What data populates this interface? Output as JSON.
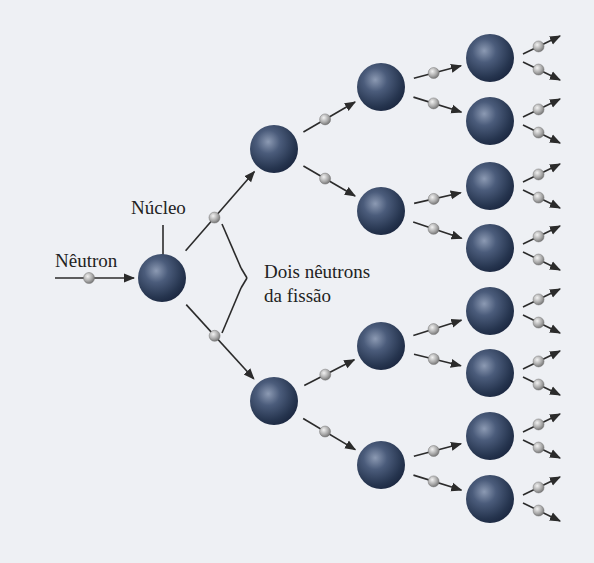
{
  "diagram": {
    "title": "",
    "type": "nuclear-fission-chain-reaction",
    "labels": {
      "neutron": "Nêutron",
      "nucleus": "Núcleo",
      "fission_neutrons_line1": "Dois nêutrons",
      "fission_neutrons_line2": "da fissão"
    },
    "colors": {
      "background": "#eef0f4",
      "nucleus": "#2e3f5c",
      "nucleus_highlight": "#8c9ab3",
      "neutron": "#a9a9a9",
      "line": "#2b2b2b",
      "text": "#222222"
    },
    "nodes": [
      {
        "id": "n0",
        "generation": 0,
        "x": 162,
        "y": 278
      },
      {
        "id": "n1a",
        "generation": 1,
        "x": 274,
        "y": 149
      },
      {
        "id": "n1b",
        "generation": 1,
        "x": 274,
        "y": 401
      },
      {
        "id": "n2a",
        "generation": 2,
        "x": 381,
        "y": 87
      },
      {
        "id": "n2b",
        "generation": 2,
        "x": 381,
        "y": 211
      },
      {
        "id": "n2c",
        "generation": 2,
        "x": 381,
        "y": 346
      },
      {
        "id": "n2d",
        "generation": 2,
        "x": 381,
        "y": 465
      },
      {
        "id": "n3a",
        "generation": 3,
        "x": 490,
        "y": 58
      },
      {
        "id": "n3b",
        "generation": 3,
        "x": 490,
        "y": 121
      },
      {
        "id": "n3c",
        "generation": 3,
        "x": 490,
        "y": 186
      },
      {
        "id": "n3d",
        "generation": 3,
        "x": 490,
        "y": 248
      },
      {
        "id": "n3e",
        "generation": 3,
        "x": 490,
        "y": 311
      },
      {
        "id": "n3f",
        "generation": 3,
        "x": 490,
        "y": 373
      },
      {
        "id": "n3g",
        "generation": 3,
        "x": 490,
        "y": 436
      },
      {
        "id": "n3h",
        "generation": 3,
        "x": 490,
        "y": 499
      }
    ],
    "edges": [
      {
        "from": "n0",
        "to": "n1a"
      },
      {
        "from": "n0",
        "to": "n1b"
      },
      {
        "from": "n1a",
        "to": "n2a"
      },
      {
        "from": "n1a",
        "to": "n2b"
      },
      {
        "from": "n1b",
        "to": "n2c"
      },
      {
        "from": "n1b",
        "to": "n2d"
      },
      {
        "from": "n2a",
        "to": "n3a"
      },
      {
        "from": "n2a",
        "to": "n3b"
      },
      {
        "from": "n2b",
        "to": "n3c"
      },
      {
        "from": "n2b",
        "to": "n3d"
      },
      {
        "from": "n2c",
        "to": "n3e"
      },
      {
        "from": "n2c",
        "to": "n3f"
      },
      {
        "from": "n2d",
        "to": "n3g"
      },
      {
        "from": "n2d",
        "to": "n3h"
      }
    ],
    "generations": 4,
    "neutrons_per_fission": 2
  }
}
